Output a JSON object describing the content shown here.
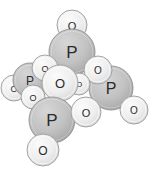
{
  "figure": {
    "name": "molecular-structure",
    "title": "",
    "background_color": "#ffffff",
    "width": 159,
    "height": 172
  },
  "palette": {
    "oxygen_fill": "#ededed",
    "oxygen_fill_dark": "#d8d8d8",
    "oxygen_stroke": "#9a9a9a",
    "phosphorus_fill": "#c4c4c4",
    "phosphorus_fill_dark": "#a6a6a6",
    "phosphorus_stroke": "#8f8f8f",
    "label_color": "#2b2b2b"
  },
  "legend": {
    "oxygen_symbol": "O",
    "phosphorus_symbol": "P"
  },
  "chart_data": {
    "type": "scatter",
    "title": "",
    "xlabel": "",
    "ylabel": "",
    "atoms": [
      {
        "id": "o-top",
        "element": "O",
        "cx": 72,
        "cy": 25,
        "r": 15,
        "z": 1
      },
      {
        "id": "p-top",
        "element": "P",
        "cx": 72,
        "cy": 52,
        "r": 23,
        "z": 2
      },
      {
        "id": "o-left-outer",
        "element": "O",
        "cx": 14,
        "cy": 88,
        "r": 13,
        "z": 3
      },
      {
        "id": "p-left",
        "element": "P",
        "cx": 30,
        "cy": 80,
        "r": 17,
        "z": 4
      },
      {
        "id": "o-upper-mid",
        "element": "O",
        "cx": 45,
        "cy": 68,
        "r": 13,
        "z": 5
      },
      {
        "id": "o-left-lower",
        "element": "O",
        "cx": 33,
        "cy": 97,
        "r": 12,
        "z": 6
      },
      {
        "id": "p-right",
        "element": "P",
        "cx": 111,
        "cy": 88,
        "r": 22,
        "z": 7
      },
      {
        "id": "o-right-upper",
        "element": "O",
        "cx": 98,
        "cy": 70,
        "r": 14,
        "z": 8
      },
      {
        "id": "o-center-small",
        "element": "O",
        "cx": 79,
        "cy": 84,
        "r": 11,
        "z": 9
      },
      {
        "id": "o-center",
        "element": "O",
        "cx": 60,
        "cy": 83,
        "r": 18,
        "z": 10
      },
      {
        "id": "p-bottom",
        "element": "P",
        "cx": 52,
        "cy": 120,
        "r": 23,
        "z": 11
      },
      {
        "id": "o-bottom-mid",
        "element": "O",
        "cx": 86,
        "cy": 112,
        "r": 15,
        "z": 12
      },
      {
        "id": "o-right-outer",
        "element": "O",
        "cx": 134,
        "cy": 110,
        "r": 14,
        "z": 13
      },
      {
        "id": "o-bottom",
        "element": "O",
        "cx": 43,
        "cy": 150,
        "r": 16,
        "z": 14
      }
    ],
    "counts": {
      "P": 4,
      "O": 10
    }
  }
}
